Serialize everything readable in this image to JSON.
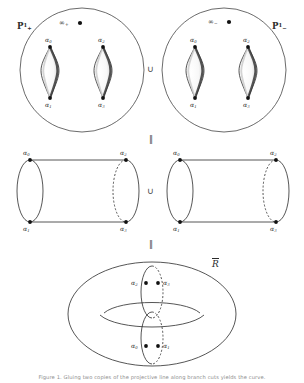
{
  "figure": {
    "title_label": "hyperelliptic-curve-construction",
    "rows": {
      "top": {
        "name": "two-projective-lines",
        "left_sheet": {
          "plane_label": "P",
          "plane_sup": "1",
          "plane_sub": "+",
          "infinity_label": "∞",
          "infinity_sub": "+",
          "branch_points": [
            {
              "label": "α",
              "sub": "0",
              "position": "top-left"
            },
            {
              "label": "α",
              "sub": "2",
              "position": "top-right"
            },
            {
              "label": "α",
              "sub": "1",
              "position": "bottom-left"
            },
            {
              "label": "α",
              "sub": "3",
              "position": "bottom-right"
            }
          ]
        },
        "right_sheet": {
          "plane_label": "P",
          "plane_sup": "1",
          "plane_sub": "−",
          "infinity_label": "∞",
          "infinity_sub": "−",
          "branch_points": [
            {
              "label": "α",
              "sub": "0",
              "position": "top-left"
            },
            {
              "label": "α",
              "sub": "2",
              "position": "top-right"
            },
            {
              "label": "α",
              "sub": "1",
              "position": "bottom-left"
            },
            {
              "label": "α",
              "sub": "3",
              "position": "bottom-right"
            }
          ]
        },
        "operator": "∪"
      },
      "middle": {
        "name": "two-cylinders",
        "left_cylinder": {
          "branch_points": [
            {
              "label": "α",
              "sub": "0",
              "position": "top-left"
            },
            {
              "label": "α",
              "sub": "2",
              "position": "top-right"
            },
            {
              "label": "α",
              "sub": "1",
              "position": "bottom-left"
            },
            {
              "label": "α",
              "sub": "3",
              "position": "bottom-right"
            }
          ]
        },
        "right_cylinder": {
          "branch_points": [
            {
              "label": "α",
              "sub": "0",
              "position": "top-left"
            },
            {
              "label": "α",
              "sub": "2",
              "position": "top-right"
            },
            {
              "label": "α",
              "sub": "1",
              "position": "bottom-left"
            },
            {
              "label": "α",
              "sub": "3",
              "position": "bottom-right"
            }
          ]
        },
        "operator": "∪"
      },
      "bottom": {
        "name": "torus",
        "curve_label": "R",
        "curve_overline": true,
        "branch_points": [
          {
            "label": "α",
            "sub": "2",
            "position": "upper-left-of-cut"
          },
          {
            "label": "α",
            "sub": "3",
            "position": "upper-right-of-cut"
          },
          {
            "label": "α",
            "sub": "0",
            "position": "lower-left-of-cut"
          },
          {
            "label": "α",
            "sub": "1",
            "position": "lower-right-of-cut"
          }
        ]
      }
    },
    "equality_symbols": [
      "‖",
      "‖"
    ],
    "colors": {
      "stroke": "#2b2b2b",
      "cut_shade_dark": "#3a3a3a",
      "cut_shade_light": "#bdbdbd",
      "point_fill": "#111111",
      "background": "#ffffff",
      "caption_text": "#8d8d8d"
    }
  },
  "caption": {
    "text": "Figure 1. Gluing two copies of the projective line along branch cuts yields the curve."
  }
}
